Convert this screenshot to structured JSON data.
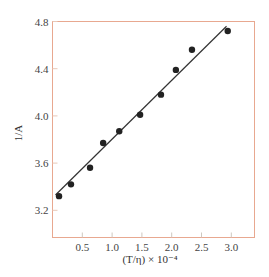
{
  "chart_data": {
    "type": "scatter",
    "title": "",
    "xlabel": "(T/η) × 10⁻⁴",
    "ylabel": "1/A",
    "xlim": [
      0,
      3.35
    ],
    "ylim": [
      2.95,
      4.8
    ],
    "x_ticks": [
      0.5,
      1.0,
      1.5,
      2.0,
      2.5,
      3.0
    ],
    "x_tick_labels": [
      "0.5",
      "1.0",
      "1.5",
      "2.0",
      "2.5",
      "3.0"
    ],
    "y_ticks": [
      3.2,
      3.6,
      4.0,
      4.4,
      4.8
    ],
    "y_tick_labels": [
      "3.2",
      "3.6",
      "4.0",
      "4.4",
      "4.8"
    ],
    "grid": false,
    "legend": null,
    "series": [
      {
        "name": "data",
        "marker": "filled-circle",
        "x": [
          0.11,
          0.31,
          0.63,
          0.85,
          1.12,
          1.47,
          1.82,
          2.07,
          2.34,
          2.94
        ],
        "y": [
          3.32,
          3.42,
          3.56,
          3.77,
          3.87,
          4.01,
          4.18,
          4.39,
          4.56,
          4.72
        ]
      },
      {
        "name": "linear fit",
        "type": "line",
        "x": [
          0.05,
          2.92
        ],
        "y": [
          3.33,
          4.76
        ]
      }
    ],
    "colors": {
      "frame": "#e8a890",
      "points": "#222222",
      "line": "#333333",
      "tick_text": "#444444"
    }
  }
}
